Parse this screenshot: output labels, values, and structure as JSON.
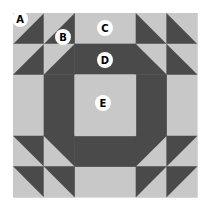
{
  "diagram": {
    "grid": {
      "units": 6,
      "origin": [
        13,
        13
      ],
      "unit_size": 30.67
    },
    "colors": {
      "light": "#c8c8c8",
      "dark": "#4a4a4a",
      "label_bg": "#ffffff",
      "label_text": "#000000"
    },
    "labels": [
      {
        "id": "A",
        "text": "A",
        "cx": 20,
        "cy": 19
      },
      {
        "id": "B",
        "text": "B",
        "cx": 63,
        "cy": 37
      },
      {
        "id": "C",
        "text": "C",
        "cx": 105,
        "cy": 28
      },
      {
        "id": "D",
        "text": "D",
        "cx": 105,
        "cy": 60
      },
      {
        "id": "E",
        "text": "E",
        "cx": 103,
        "cy": 103
      }
    ]
  }
}
